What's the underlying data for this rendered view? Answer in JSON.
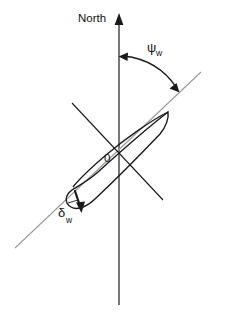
{
  "figure": {
    "type": "vector-diagram",
    "background_color": "#ffffff",
    "ink_color": "#111111",
    "reference_line_color": "#999999"
  },
  "labels": {
    "north": "North",
    "origin": "0",
    "heading_angle_symbol": "ψ",
    "heading_angle_subscript": "w",
    "rudder_angle_symbol": "δ",
    "rudder_angle_subscript": "w"
  },
  "geometry": {
    "north_axis": {
      "x": 119,
      "y_top": 14,
      "y_bottom": 305,
      "arrow_tip_y": 14
    },
    "heading_line": {
      "x1": 15,
      "y1": 248,
      "x2": 200,
      "y2": 73
    },
    "body_transverse_axis": {
      "x1": 72,
      "y1": 103,
      "x2": 163,
      "y2": 200
    },
    "heading_arc": {
      "start_x": 119,
      "start_y": 57,
      "end_x": 178,
      "end_y": 90,
      "double_headed": true
    },
    "hull": {
      "bow_x": 168,
      "bow_y": 112,
      "stern_x": 70,
      "stern_y": 195
    },
    "rudder": {
      "x1": 76,
      "y1": 192,
      "x2": 82,
      "y2": 213
    }
  }
}
